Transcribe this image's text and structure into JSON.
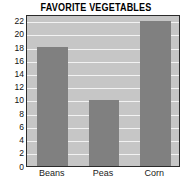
{
  "chart_data": {
    "type": "bar",
    "title": "FAVORITE VEGETABLES",
    "categories": [
      "Beans",
      "Peas",
      "Corn"
    ],
    "values": [
      18,
      10,
      22
    ],
    "xlabel": "",
    "ylabel": "",
    "ylim": [
      0,
      23
    ],
    "yticks": [
      0,
      2,
      4,
      6,
      8,
      10,
      12,
      14,
      16,
      18,
      20,
      22
    ],
    "ytick_labels": [
      "0",
      "2",
      "4",
      "6",
      "8",
      "10",
      "12",
      "14",
      "16",
      "18",
      "20",
      "22"
    ],
    "grid": "horizontal",
    "legend": "none",
    "colors": {
      "bar_fill": "#808080",
      "plot_background": "#c6c6c6",
      "gridline": "#f2f2f2",
      "axis_border": "#2b2b2b",
      "title_text": "#000000",
      "tick_text": "#111111"
    }
  }
}
